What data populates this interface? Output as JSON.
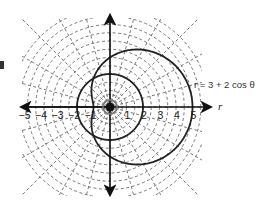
{
  "chart_data": {
    "type": "line",
    "coordinate_system": "polar",
    "title": "",
    "equation_label": "r = 3 + 2 cos θ",
    "axis_label_r": "r",
    "x_tick_labels": [
      "−5",
      "−4",
      "−3",
      "−2",
      "−1",
      "1",
      "2",
      "3",
      "4",
      "5"
    ],
    "x_tick_values": [
      -5,
      -4,
      -3,
      -2,
      -1,
      1,
      2,
      3,
      4,
      5
    ],
    "xlim": [
      -5.5,
      5.5
    ],
    "ylim": [
      -5.5,
      5.5
    ],
    "grid": {
      "type": "polar-dashed",
      "circle_radii": [
        0.25,
        0.5,
        0.75,
        1,
        1.5,
        2,
        2.5,
        3,
        3.5,
        4,
        4.5,
        5,
        5.5,
        6
      ],
      "radial_step_degrees": 15
    },
    "series": [
      {
        "name": "r = 3 + 2 cos θ",
        "kind": "limacon",
        "formula": "3 + 2*cos(theta)",
        "points_r_theta_deg": [
          [
            5,
            0
          ],
          [
            4.73,
            30
          ],
          [
            4,
            60
          ],
          [
            3,
            90
          ],
          [
            2,
            120
          ],
          [
            1.27,
            150
          ],
          [
            1,
            180
          ],
          [
            1.27,
            210
          ],
          [
            2,
            240
          ],
          [
            3,
            270
          ],
          [
            4,
            300
          ],
          [
            4.73,
            330
          ]
        ]
      },
      {
        "name": "r = 2",
        "kind": "circle",
        "formula": "2",
        "points_r_theta_deg": [
          [
            2,
            0
          ],
          [
            2,
            90
          ],
          [
            2,
            180
          ],
          [
            2,
            270
          ]
        ]
      }
    ],
    "legend": "none"
  },
  "labels": {
    "equation": "r = 3 + 2 cos θ",
    "r_axis": "r"
  },
  "colors": {
    "curve": "#222222",
    "axis": "#111111",
    "grid": "#555555",
    "background": "#ffffff"
  }
}
